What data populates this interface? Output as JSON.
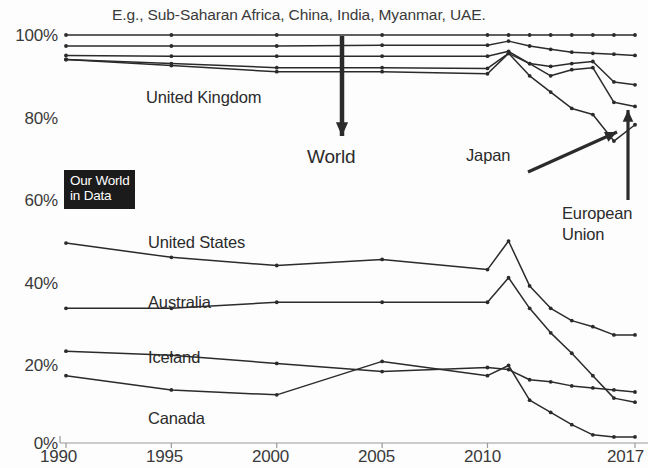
{
  "branding": {
    "logo_line1": "Our World",
    "logo_line2": "in Data"
  },
  "annotations": {
    "top_note": "E.g., Sub-Saharan Africa, China, India, Myanmar, UAE.",
    "world_label": "World",
    "japan_label": "Japan",
    "eu_label_line1": "European",
    "eu_label_line2": "Union",
    "uk_label": "United Kingdom",
    "us_label": "United States",
    "australia_label": "Australia",
    "iceland_label": "Iceland",
    "canada_label": "Canada"
  },
  "colors": {
    "line": "#2b2b2b",
    "axis": "#9a9a9a",
    "text": "#2b2b2b",
    "background": "#fdfdfd",
    "logo_background": "#1b1b1b",
    "logo_text": "#ffffff"
  },
  "chart_data": {
    "type": "line",
    "title": "",
    "subtitle": "",
    "xlabel": "",
    "ylabel": "",
    "xlim": [
      1990,
      2017
    ],
    "ylim": [
      0,
      100
    ],
    "grid": false,
    "legend": "inline-labels",
    "x_ticks": [
      1990,
      1995,
      2000,
      2005,
      2010,
      2017
    ],
    "x_tick_labels": [
      "1990",
      "1995",
      "2000",
      "2005",
      "2010",
      "2017"
    ],
    "y_ticks": [
      0,
      20,
      40,
      60,
      80,
      100
    ],
    "y_tick_labels": [
      "0%",
      "20%",
      "40%",
      "60%",
      "80%",
      "100%"
    ],
    "series": [
      {
        "name": "World",
        "x": [
          1990,
          1995,
          2000,
          2005,
          2010,
          2011,
          2012,
          2013,
          2014,
          2015,
          2016,
          2017
        ],
        "values": [
          100,
          100,
          100,
          100,
          100,
          100,
          100,
          100,
          100,
          100,
          100,
          100
        ]
      },
      {
        "name": "Sub-Saharan Africa group",
        "x": [
          1990,
          1995,
          2000,
          2005,
          2010,
          2011,
          2012,
          2013,
          2014,
          2015,
          2016,
          2017
        ],
        "values": [
          97.3,
          97.3,
          97.3,
          97.5,
          97.5,
          98.5,
          97.3,
          96.5,
          95.8,
          95.5,
          95.3,
          95.0
        ]
      },
      {
        "name": "United Kingdom",
        "x": [
          1990,
          1995,
          2000,
          2005,
          2010,
          2011,
          2012,
          2013,
          2014,
          2015,
          2016,
          2017
        ],
        "values": [
          95.0,
          94.8,
          94.8,
          94.8,
          94.8,
          96.0,
          93.0,
          92.3,
          93.0,
          93.5,
          88.5,
          87.8
        ],
        "note": "upper mid band"
      },
      {
        "name": "Japan",
        "x": [
          1990,
          1995,
          2000,
          2005,
          2010,
          2011,
          2012,
          2013,
          2014,
          2015,
          2016,
          2017
        ],
        "values": [
          94.0,
          93.0,
          92.0,
          92.0,
          91.8,
          95.5,
          93.0,
          90.0,
          91.5,
          92.0,
          83.5,
          82.5
        ]
      },
      {
        "name": "European Union",
        "x": [
          1990,
          1995,
          2000,
          2005,
          2010,
          2011,
          2012,
          2013,
          2014,
          2015,
          2016,
          2017
        ],
        "values": [
          94.0,
          92.5,
          91.0,
          91.0,
          90.5,
          95.5,
          90.0,
          86.0,
          82.0,
          80.5,
          74.0,
          78.0
        ]
      },
      {
        "name": "United States",
        "x": [
          1990,
          1995,
          2000,
          2005,
          2010,
          2011,
          2012,
          2013,
          2014,
          2015,
          2016,
          2017
        ],
        "values": [
          49.0,
          45.5,
          43.5,
          45.0,
          42.5,
          49.5,
          38.5,
          33.0,
          30.0,
          28.5,
          26.5,
          26.5
        ]
      },
      {
        "name": "Australia",
        "x": [
          1990,
          1995,
          2000,
          2005,
          2010,
          2011,
          2012,
          2013,
          2014,
          2015,
          2016,
          2017
        ],
        "values": [
          33.0,
          33.0,
          34.5,
          34.5,
          34.5,
          40.5,
          33.0,
          27.0,
          22.0,
          16.5,
          11.0,
          10.0
        ]
      },
      {
        "name": "Iceland",
        "x": [
          1990,
          1995,
          2000,
          2005,
          2010,
          2011,
          2012,
          2013,
          2014,
          2015,
          2016,
          2017
        ],
        "values": [
          22.5,
          21.5,
          19.5,
          17.5,
          18.5,
          18.0,
          15.5,
          15.0,
          14.0,
          13.5,
          13.0,
          12.5
        ]
      },
      {
        "name": "Canada",
        "x": [
          1990,
          1995,
          2000,
          2005,
          2010,
          2011,
          2012,
          2013,
          2014,
          2015,
          2016,
          2017
        ],
        "values": [
          16.5,
          13.0,
          11.8,
          20.0,
          16.5,
          19.0,
          10.5,
          7.5,
          4.5,
          2.0,
          1.5,
          1.5
        ]
      }
    ]
  }
}
